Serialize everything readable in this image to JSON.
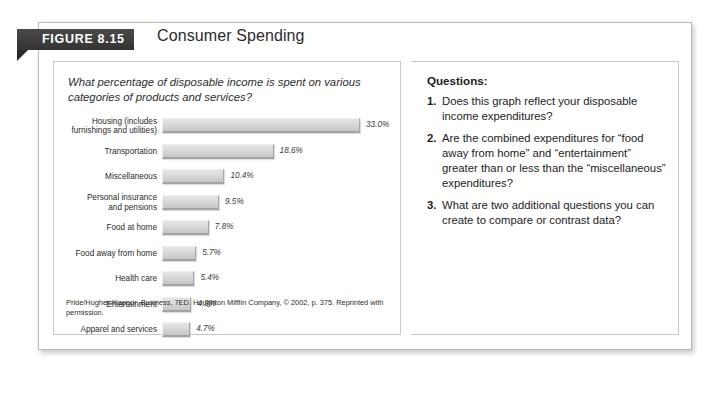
{
  "figure": {
    "tab_label": "FIGURE 8.15",
    "title": "Consumer Spending"
  },
  "chart_panel": {
    "question": "What percentage of disposable income is spent on various categories of products and services?",
    "source_prefix": "Pride/Hughes/Kapoor. ",
    "source_italic": "Business",
    "source_suffix": ", 7ED. Houghton Mifflin Company, © 2002, p. 375. Reprinted with permission."
  },
  "questions_panel": {
    "heading": "Questions:",
    "items": [
      {
        "num": "1.",
        "text": "Does this graph reflect your disposable income expenditures?"
      },
      {
        "num": "2.",
        "text": "Are the combined expenditures for “food away from home” and “entertainment” greater than or less than the “miscellaneous” expenditures?"
      },
      {
        "num": "3.",
        "text": "What are two additional questions you can create to compare or contrast data?"
      }
    ]
  },
  "chart_data": {
    "type": "bar",
    "orientation": "horizontal",
    "title": "Consumer Spending",
    "xlabel": "",
    "ylabel": "",
    "xlim": [
      0,
      33.0
    ],
    "grid": false,
    "legend": false,
    "value_suffix": "%",
    "categories": [
      "Housing (includes furnishings and utilities)",
      "Transportation",
      "Miscellaneous",
      "Personal insurance and pensions",
      "Food at home",
      "Food away from home",
      "Health care",
      "Entertainment",
      "Apparel and services"
    ],
    "values": [
      33.0,
      18.6,
      10.4,
      9.5,
      7.8,
      5.7,
      5.4,
      4.9,
      4.7
    ],
    "labels": [
      "33.0%",
      "18.6%",
      "10.4%",
      "9.5%",
      "7.8%",
      "5.7%",
      "5.4%",
      "4.9%",
      "4.7%"
    ],
    "bars": [
      {
        "label_line1": "Housing (includes",
        "label_line2": "furnishings and utilities)",
        "value": 33.0,
        "value_label": "33.0%"
      },
      {
        "label_line1": "Transportation",
        "label_line2": "",
        "value": 18.6,
        "value_label": "18.6%"
      },
      {
        "label_line1": "Miscellaneous",
        "label_line2": "",
        "value": 10.4,
        "value_label": "10.4%"
      },
      {
        "label_line1": "Personal insurance",
        "label_line2": "and pensions",
        "value": 9.5,
        "value_label": "9.5%"
      },
      {
        "label_line1": "Food at home",
        "label_line2": "",
        "value": 7.8,
        "value_label": "7.8%"
      },
      {
        "label_line1": "Food away from home",
        "label_line2": "",
        "value": 5.7,
        "value_label": "5.7%"
      },
      {
        "label_line1": "Health care",
        "label_line2": "",
        "value": 5.4,
        "value_label": "5.4%"
      },
      {
        "label_line1": "Entertainment",
        "label_line2": "",
        "value": 4.9,
        "value_label": "4.9%"
      },
      {
        "label_line1": "Apparel and services",
        "label_line2": "",
        "value": 4.7,
        "value_label": "4.7%"
      }
    ]
  },
  "colors": {
    "tab_background": "#3a3a3a",
    "bar_fill": "#dcdcdc",
    "bar_shadow": "#a3a3a3",
    "panel_border": "#c9c9c9",
    "text": "#1c1c1c"
  }
}
